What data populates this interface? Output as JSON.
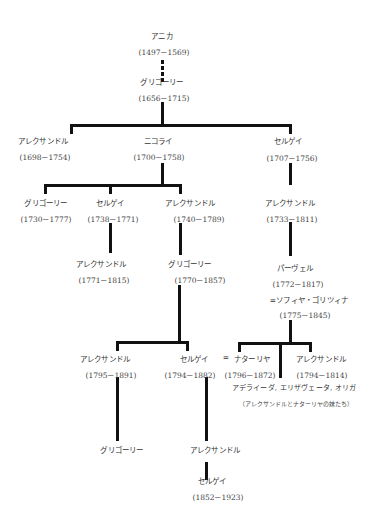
{
  "tree": {
    "anika": {
      "name": "アニカ",
      "dates": "(1497－1569)"
    },
    "grigory1": {
      "name": "グリゴーリー",
      "dates": "(1656－1715)"
    },
    "alexander1": {
      "name": "アレクサンドル",
      "dates": "(1698－1754)"
    },
    "nikolai": {
      "name": "ニコライ",
      "dates": "(1700－1758)"
    },
    "sergei1": {
      "name": "セルゲイ",
      "dates": "(1707－1756)"
    },
    "grigory2": {
      "name": "グリゴーリー",
      "dates": "(1730－1777)"
    },
    "sergei2": {
      "name": "セルゲイ",
      "dates": "(1738－1771)"
    },
    "alexander2": {
      "name": "アレクサンドル",
      "dates": "(1740－1789)"
    },
    "alexander3": {
      "name": "アレクサンドル",
      "dates": "(1733－1811)"
    },
    "alexander4": {
      "name": "アレクサンドル",
      "dates": "(1771－1815)"
    },
    "grigory3": {
      "name": "グリゴーリー",
      "dates": "(1770－1857)"
    },
    "pavel": {
      "name": "パーヴェル",
      "dates": "(1772－1817)",
      "spouse": "=ソフィヤ・ゴリツィナ",
      "spouse_dates": "(1775－1845)"
    },
    "alexander5": {
      "name": "アレクサンドル",
      "dates": "(1795－1891)"
    },
    "sergei3": {
      "name": "セルゲイ",
      "dates": "(1794－1882)"
    },
    "marriage_sign": "=",
    "natalia": {
      "name": "ナターリヤ",
      "dates": "(1796－1872)"
    },
    "alexander6": {
      "name": "アレクサンドル",
      "dates": "(1794－1814)"
    },
    "sisters": {
      "names": "アデライーダ, エリザヴェータ, オリガ",
      "note": "（アレクサンドルとナターリヤの妹たち）"
    },
    "grigory4": {
      "name": "グリゴーリー"
    },
    "alexander7": {
      "name": "アレクサンドル"
    },
    "sergei4": {
      "name": "セルゲイ",
      "dates": "(1852－1923)"
    }
  },
  "colors": {
    "line": "#111111",
    "text": "#333333",
    "background": "#ffffff"
  }
}
